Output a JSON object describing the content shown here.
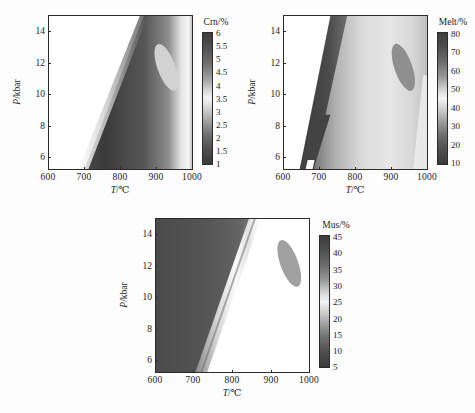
{
  "figure": {
    "background": "#fdfdfd",
    "axis_color": "#2b2b2b",
    "panel_count": 3
  },
  "chart_data": [
    {
      "type": "heatmap",
      "panel_id": "a",
      "title": "",
      "xlabel": "T/℃",
      "ylabel": "P/kbar",
      "xlim": [
        600,
        1000
      ],
      "ylim": [
        5.2,
        15
      ],
      "xticks": [
        600,
        700,
        800,
        900,
        1000
      ],
      "xticklabels": [
        "600",
        "700",
        "800",
        "900",
        "1000"
      ],
      "yticks": [
        6,
        8,
        10,
        12,
        14
      ],
      "yticklabels": [
        "6",
        "8",
        "10",
        "12",
        "14"
      ],
      "grid": false,
      "colorbar": {
        "label": "Crn/%",
        "vmin": 1,
        "vmax": 6,
        "ticks": [
          6,
          5.5,
          5,
          4.5,
          4,
          3.5,
          3,
          2.5,
          2,
          1.5,
          1
        ],
        "ticklabels": [
          "6",
          "5.5",
          "5",
          "4.5",
          "4",
          "3.5",
          "3",
          "2.5",
          "2",
          "1.5",
          "1"
        ],
        "orientation": "vertical",
        "position": "right"
      },
      "field_description": "Blank (no-data) wedge at low T; dark high-Crn band rising diagonally from ~700℃ at 5 kbar to ~880℃ at 15 kbar; bright low-value streak along the high-T boundary; light elliptical inclusion centred near 950℃ / 11.5 kbar.",
      "ellipse": {
        "cx_T": 952,
        "cy_P": 11.6,
        "rx_T": 26,
        "ry_P": 2.3,
        "angle_deg": -22,
        "shade": "light"
      }
    },
    {
      "type": "heatmap",
      "panel_id": "b",
      "title": "",
      "xlabel": "T/℃",
      "ylabel": "P/kbar",
      "xlim": [
        600,
        1000
      ],
      "ylim": [
        5.2,
        15
      ],
      "xticks": [
        600,
        700,
        800,
        900,
        1000
      ],
      "xticklabels": [
        "600",
        "700",
        "800",
        "900",
        "1000"
      ],
      "yticks": [
        6,
        8,
        10,
        12,
        14
      ],
      "yticklabels": [
        "6",
        "8",
        "10",
        "12",
        "14"
      ],
      "grid": false,
      "colorbar": {
        "label": "Melt/%",
        "vmin": 10,
        "vmax": 80,
        "ticks": [
          80,
          70,
          60,
          50,
          40,
          30,
          20,
          10
        ],
        "ticklabels": [
          "80",
          "70",
          "60",
          "50",
          "40",
          "30",
          "20",
          "10"
        ],
        "orientation": "vertical",
        "position": "right"
      },
      "field_description": "Blank solidus wedge at low T; narrow dark high-melt-fraction band hugging the solidus; broad pale (low melt %) interior expanding toward high T; darker elliptical inclusion near 955℃ / 11.5 kbar.",
      "ellipse": {
        "cx_T": 955,
        "cy_P": 11.5,
        "rx_T": 24,
        "ry_P": 2.3,
        "angle_deg": -20,
        "shade": "dark"
      }
    },
    {
      "type": "heatmap",
      "panel_id": "c",
      "title": "",
      "xlabel": "T/℃",
      "ylabel": "P/kbar",
      "xlim": [
        600,
        1000
      ],
      "ylim": [
        5.2,
        15
      ],
      "xticks": [
        600,
        700,
        800,
        900,
        1000
      ],
      "xticklabels": [
        "600",
        "700",
        "800",
        "900",
        "1000"
      ],
      "yticks": [
        6,
        8,
        10,
        12,
        14
      ],
      "yticklabels": [
        "6",
        "8",
        "10",
        "12",
        "14"
      ],
      "grid": false,
      "colorbar": {
        "label": "Mus/%",
        "vmin": 5,
        "vmax": 45,
        "ticks": [
          45,
          40,
          35,
          30,
          25,
          20,
          15,
          10,
          5
        ],
        "ticklabels": [
          "45",
          "40",
          "35",
          "30",
          "25",
          "20",
          "15",
          "10",
          "5"
        ],
        "orientation": "vertical",
        "position": "right"
      },
      "field_description": "Dark high-muscovite region at low T/high P; sharp bright low-Mus breakdown band running diagonally from ~690℃ at 5 kbar to ~870℃ at 15 kbar; blank (muscovite-absent) field at high T; grey elliptical inclusion near 950℃ / 12 kbar.",
      "ellipse": {
        "cx_T": 950,
        "cy_P": 12.0,
        "rx_T": 22,
        "ry_P": 2.2,
        "angle_deg": -20,
        "shade": "mid"
      }
    }
  ]
}
